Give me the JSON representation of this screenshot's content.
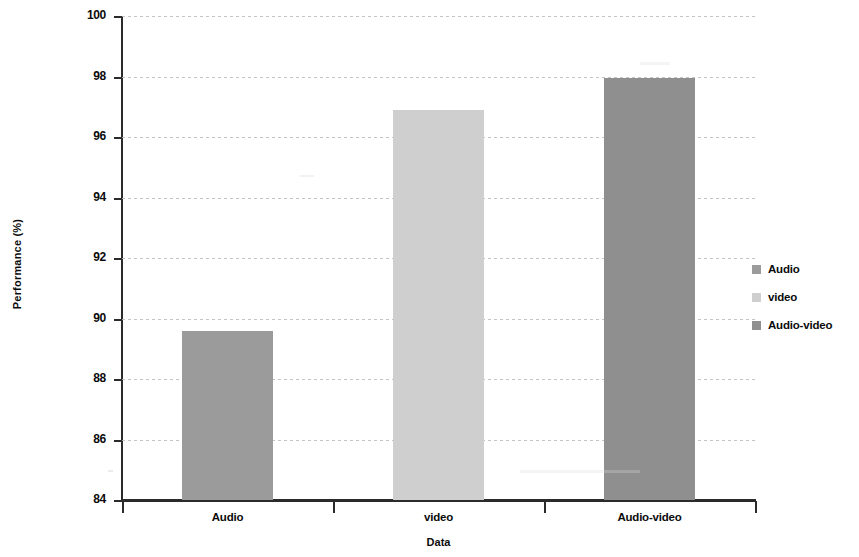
{
  "chart_data": {
    "type": "bar",
    "title": "",
    "xlabel": "Data",
    "ylabel": "Performance (%)",
    "categories": [
      "Audio",
      "video",
      "Audio-video"
    ],
    "values": [
      89.6,
      96.9,
      97.95
    ],
    "ylim": [
      84,
      100
    ],
    "yticks": [
      84,
      86,
      88,
      90,
      92,
      94,
      96,
      98,
      100
    ],
    "ytick_labels": [
      "84",
      "86",
      "88",
      "90",
      "92",
      "94",
      "96",
      "98",
      "100"
    ],
    "grid": true,
    "grid_axis": "y",
    "legend_position": "right",
    "series": [
      {
        "name": "Audio",
        "value": 89.6,
        "color": "#9b9b9b"
      },
      {
        "name": "video",
        "value": 96.9,
        "color": "#cfcfcf"
      },
      {
        "name": "Audio-video",
        "value": 97.95,
        "color": "#8f8f8f"
      }
    ],
    "legend": [
      {
        "label": "Audio",
        "color": "#9b9b9b"
      },
      {
        "label": "video",
        "color": "#cfcfcf"
      },
      {
        "label": "Audio-video",
        "color": "#8f8f8f"
      }
    ]
  },
  "axis": {
    "y_title": "Performance (%)",
    "x_title": "Data"
  },
  "colors": {
    "axis": "#2b2b2b",
    "grid": "#b9b9b9",
    "text": "#0b0b0b",
    "background": "#ffffff"
  }
}
